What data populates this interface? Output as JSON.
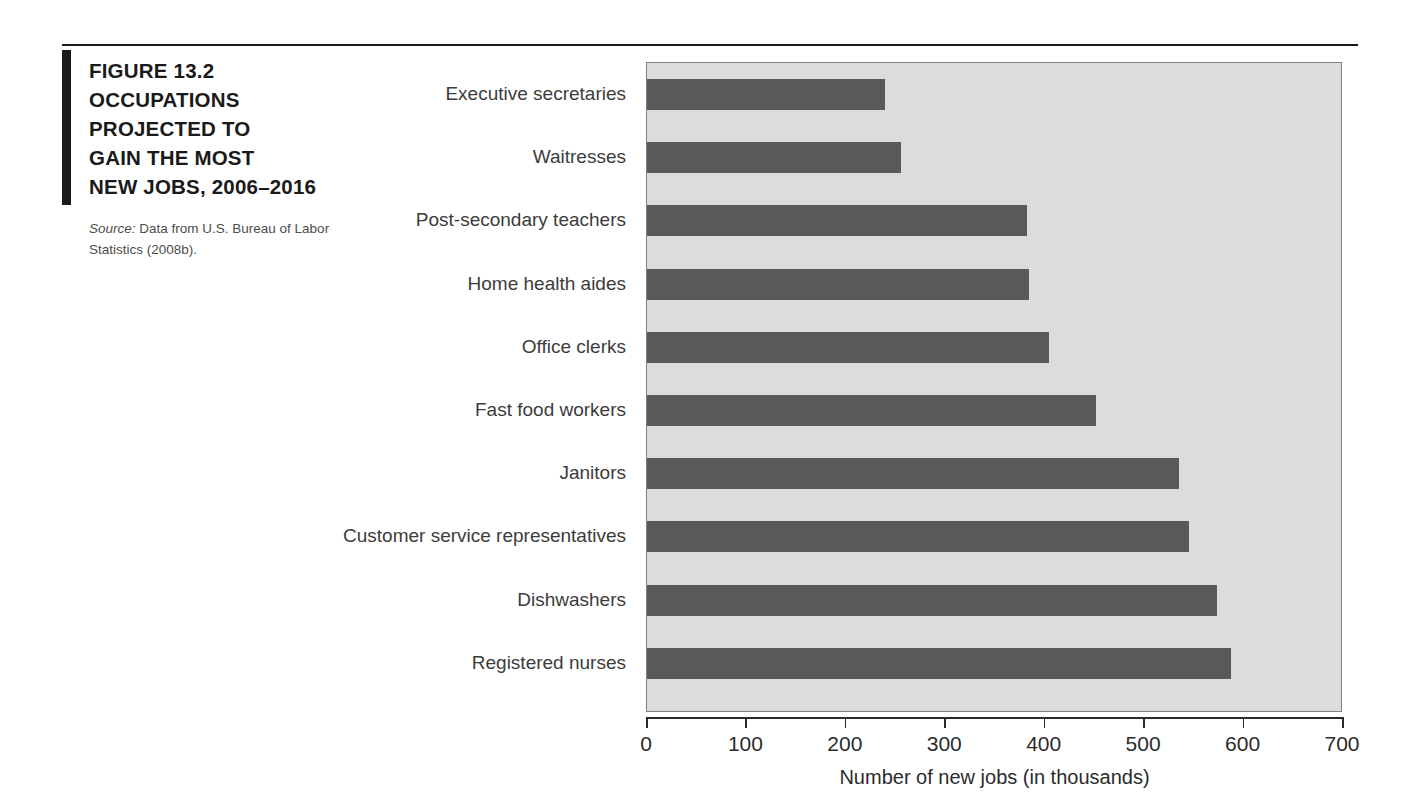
{
  "figure": {
    "title_lines": [
      "FIGURE 13.2",
      "OCCUPATIONS",
      "PROJECTED TO",
      "GAIN THE MOST",
      "NEW JOBS, 2006–2016"
    ],
    "source_label": "Source:",
    "source_text": " Data from U.S. Bureau of Labor Statistics (2008b)."
  },
  "colors": {
    "bar": "#595959",
    "plot_background": "#dcdcdc",
    "accent": "#1a1a1a",
    "axis": "#2b2b2b"
  },
  "chart_data": {
    "type": "bar",
    "orientation": "horizontal",
    "title": "FIGURE 13.2 OCCUPATIONS PROJECTED TO GAIN THE MOST NEW JOBS, 2006–2016",
    "xlabel": "Number of new jobs (in thousands)",
    "ylabel": "",
    "xlim": [
      0,
      700
    ],
    "xticks": [
      0,
      100,
      200,
      300,
      400,
      500,
      600,
      700
    ],
    "xtick_labels": [
      "0",
      "100",
      "200",
      "300",
      "400",
      "500",
      "600",
      "700"
    ],
    "grid": false,
    "legend": false,
    "categories": [
      "Executive secretaries",
      "Waitresses",
      "Post-secondary teachers",
      "Home health aides",
      "Office clerks",
      "Fast food workers",
      "Janitors",
      "Customer service representatives",
      "Dishwashers",
      "Registered nurses"
    ],
    "values": [
      239,
      255,
      382,
      384,
      404,
      452,
      535,
      545,
      573,
      587
    ]
  }
}
